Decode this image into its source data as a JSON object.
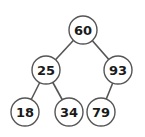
{
  "diagram": {
    "type": "binary-tree",
    "colors": {
      "stroke": "#555555",
      "text": "#1a1a1a",
      "fill": "#ffffff"
    },
    "node_radius": 14,
    "nodes": [
      {
        "id": "n60",
        "value": "60",
        "cx": 83,
        "cy": 30
      },
      {
        "id": "n25",
        "value": "25",
        "cx": 46,
        "cy": 70
      },
      {
        "id": "n93",
        "value": "93",
        "cx": 118,
        "cy": 70
      },
      {
        "id": "n18",
        "value": "18",
        "cx": 25,
        "cy": 112
      },
      {
        "id": "n34",
        "value": "34",
        "cx": 69,
        "cy": 112
      },
      {
        "id": "n79",
        "value": "79",
        "cx": 101,
        "cy": 112
      }
    ],
    "edges": [
      {
        "from": "n60",
        "to": "n25"
      },
      {
        "from": "n60",
        "to": "n93"
      },
      {
        "from": "n25",
        "to": "n18"
      },
      {
        "from": "n25",
        "to": "n34"
      },
      {
        "from": "n93",
        "to": "n79"
      }
    ]
  }
}
